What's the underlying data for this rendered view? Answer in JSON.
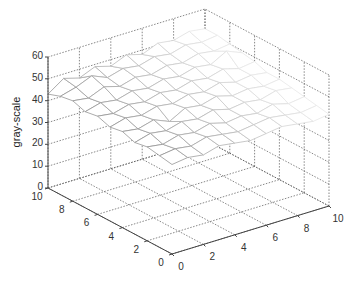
{
  "chart_data": {
    "type": "surface3d",
    "title": "",
    "xlabel": "",
    "ylabel": "",
    "zlabel": "gray-scale",
    "xlim": [
      0,
      10
    ],
    "ylim": [
      0,
      10
    ],
    "zlim": [
      0,
      60
    ],
    "x_ticks": [
      "0",
      "2",
      "4",
      "6",
      "8",
      "10"
    ],
    "y_ticks": [
      "0",
      "2",
      "4",
      "6",
      "8",
      "10"
    ],
    "z_ticks": [
      "0",
      "10",
      "20",
      "30",
      "40",
      "50",
      "60"
    ],
    "grid": true,
    "x": [
      0,
      1,
      2,
      3,
      4,
      5,
      6,
      7,
      8,
      9,
      10
    ],
    "y": [
      0,
      1,
      2,
      3,
      4,
      5,
      6,
      7,
      8,
      9,
      10
    ],
    "z": [
      [
        41,
        42,
        41,
        43,
        42,
        41,
        42,
        43,
        42,
        41,
        42
      ],
      [
        42,
        43,
        42,
        44,
        43,
        42,
        43,
        44,
        43,
        42,
        43
      ],
      [
        43,
        42,
        44,
        43,
        45,
        43,
        44,
        43,
        45,
        43,
        44
      ],
      [
        42,
        44,
        43,
        45,
        44,
        46,
        44,
        45,
        44,
        46,
        45
      ],
      [
        44,
        43,
        45,
        42,
        46,
        45,
        47,
        45,
        46,
        45,
        46
      ],
      [
        43,
        45,
        44,
        46,
        45,
        47,
        46,
        48,
        46,
        47,
        46
      ],
      [
        45,
        44,
        46,
        45,
        47,
        46,
        48,
        47,
        49,
        47,
        48
      ],
      [
        44,
        46,
        45,
        47,
        46,
        48,
        47,
        49,
        48,
        52,
        49
      ],
      [
        46,
        45,
        48,
        46,
        48,
        47,
        49,
        48,
        50,
        49,
        50
      ],
      [
        45,
        47,
        50,
        47,
        49,
        48,
        50,
        49,
        51,
        50,
        51
      ],
      [
        43,
        48,
        46,
        49,
        47,
        50,
        48,
        51,
        50,
        52,
        51
      ]
    ]
  }
}
